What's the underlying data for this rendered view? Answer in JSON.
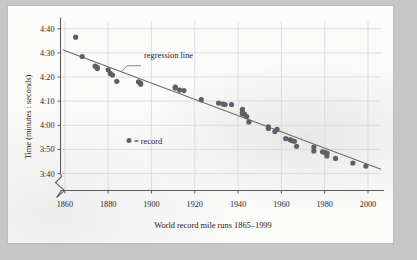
{
  "figure": {
    "background_color": "#c6c6c6",
    "page_color": "#fbfbfa",
    "dot_color": "#5c6067",
    "line_color": "#6b6b6b",
    "grid_color": "#cfd3dc"
  },
  "annotations": {
    "regression_label": "regression line",
    "legend_symbol": "●",
    "legend_text": "= record",
    "axis_break_symbol": "zigzag-break"
  },
  "chart_data": {
    "type": "scatter",
    "title": "",
    "xlabel": "World record mile runs 1865–1999",
    "ylabel": "Time (minutes : seconds)",
    "xlim": [
      1858,
      2006
    ],
    "ylim": [
      213,
      283
    ],
    "xticks": [
      1860,
      1880,
      1900,
      1920,
      1940,
      1960,
      1980,
      2000
    ],
    "xticklabels": [
      "1860",
      "1880",
      "1900",
      "1920",
      "1940",
      "1960",
      "1980",
      "2000"
    ],
    "yticks": [
      280,
      270,
      260,
      250,
      240,
      230,
      220
    ],
    "yticklabels": [
      "4:40",
      "4:30",
      "4:20",
      "4:10",
      "4:00",
      "3:50",
      "3:40"
    ],
    "y_unit": "seconds (displayed as minutes:seconds)",
    "y_axis_broken_below": "3:40",
    "grid": true,
    "grid_axis": "both",
    "legend": {
      "position": "inside-left",
      "entries": [
        {
          "marker": "circle",
          "label": "= record"
        }
      ]
    },
    "series": [
      {
        "name": "record",
        "marker": "circle",
        "x": [
          1865,
          1868,
          1874,
          1875,
          1875,
          1880,
          1881,
          1882,
          1884,
          1894,
          1895,
          1895,
          1911,
          1911,
          1913,
          1915,
          1923,
          1931,
          1933,
          1934,
          1937,
          1942,
          1942,
          1942,
          1943,
          1944,
          1945,
          1954,
          1954,
          1957,
          1958,
          1962,
          1964,
          1965,
          1966,
          1967,
          1975,
          1975,
          1979,
          1980,
          1981,
          1981,
          1981,
          1985,
          1993,
          1999
        ],
        "y": [
          276.5,
          268.5,
          264.5,
          264.0,
          263.5,
          263.0,
          261.5,
          260.8,
          258.2,
          258.0,
          257.5,
          257.0,
          255.8,
          255.5,
          254.6,
          254.4,
          250.6,
          249.2,
          248.8,
          248.6,
          248.6,
          246.6,
          245.4,
          244.8,
          244.6,
          243.6,
          241.4,
          239.4,
          238.7,
          237.4,
          238.3,
          234.5,
          234.1,
          233.6,
          233.4,
          231.3,
          231.0,
          229.4,
          229.0,
          228.8,
          228.5,
          228.4,
          227.3,
          226.3,
          224.4,
          223.1
        ],
        "y_display": [
          "4:36.5",
          "4:28.5",
          "4:24.5",
          "4:24.0",
          "4:23.5",
          "4:23.0",
          "4:21.5",
          "4:20.8",
          "4:18.2",
          "4:18.0",
          "4:17.5",
          "4:17.0",
          "4:15.8",
          "4:15.5",
          "4:14.6",
          "4:14.4",
          "4:10.6",
          "4:09.2",
          "4:08.8",
          "4:08.6",
          "4:08.6",
          "4:06.6",
          "4:05.4",
          "4:04.8",
          "4:04.6",
          "4:03.6",
          "4:01.4",
          "3:59.4",
          "3:58.7",
          "3:57.4",
          "3:58.3",
          "3:54.5",
          "3:54.1",
          "3:53.6",
          "3:53.4",
          "3:51.3",
          "3:51.0",
          "3:49.4",
          "3:49.0",
          "3:48.8",
          "3:48.5",
          "3:48.4",
          "3:47.3",
          "3:46.3",
          "3:44.4",
          "3:43.1"
        ]
      }
    ],
    "trendline": {
      "name": "regression line",
      "type": "linear",
      "x_endpoints": [
        1859,
        2006
      ],
      "y_endpoints": [
        271.3,
        221.8
      ],
      "y_display_endpoints": [
        "4:31.3",
        "3:41.8"
      ]
    }
  }
}
